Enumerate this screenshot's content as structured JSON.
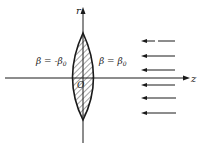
{
  "diagram": {
    "axes": {
      "vertical_label": "r",
      "horizontal_label": "z",
      "origin_label": "O"
    },
    "lens": {
      "left_boundary_label": "β = -β",
      "left_boundary_sub": "0",
      "right_boundary_label": "β = β",
      "right_boundary_sub": "0",
      "fill": "hatched"
    },
    "incident_arrows": {
      "count": 6,
      "direction": "left",
      "y_positions": [
        41,
        56,
        70,
        85,
        98,
        113
      ]
    },
    "colors": {
      "ink": "#1a1a1a",
      "background": "#ffffff"
    }
  }
}
